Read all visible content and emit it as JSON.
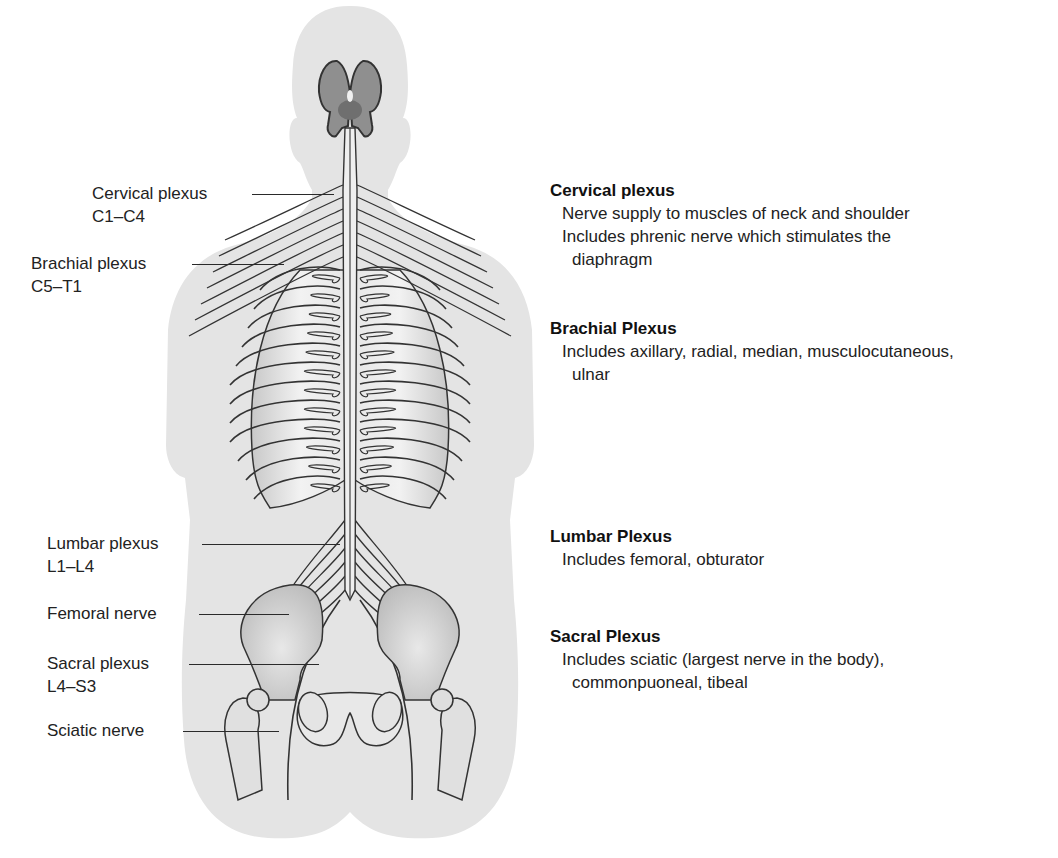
{
  "diagram": {
    "colors": {
      "body_silhouette": "#e4e4e4",
      "rib_cage": "#d2d2d2",
      "brain": "#8a8a8a",
      "nerve_stroke": "#333333"
    }
  },
  "left_labels": [
    {
      "id": "cervical",
      "name": "Cervical plexus",
      "range": "C1–C4"
    },
    {
      "id": "brachial",
      "name": "Brachial plexus",
      "range": "C5–T1"
    },
    {
      "id": "lumbar",
      "name": "Lumbar plexus",
      "range": "L1–L4"
    },
    {
      "id": "femoral",
      "name": "Femoral nerve",
      "range": ""
    },
    {
      "id": "sacral",
      "name": "Sacral plexus",
      "range": "L4–S3"
    },
    {
      "id": "sciatic",
      "name": "Sciatic nerve",
      "range": ""
    }
  ],
  "descriptions": [
    {
      "title": "Cervical plexus",
      "lines": [
        {
          "text": "Nerve supply to muscles of neck and shoulder",
          "cont": false
        },
        {
          "text": "Includes phrenic nerve which stimulates the",
          "cont": false
        },
        {
          "text": "diaphragm",
          "cont": true
        }
      ]
    },
    {
      "title": "Brachial Plexus",
      "lines": [
        {
          "text": "Includes axillary, radial, median, musculocutaneous,",
          "cont": false
        },
        {
          "text": "ulnar",
          "cont": true
        }
      ]
    },
    {
      "title": "Lumbar Plexus",
      "lines": [
        {
          "text": "Includes femoral, obturator",
          "cont": false
        }
      ]
    },
    {
      "title": "Sacral Plexus",
      "lines": [
        {
          "text": "Includes sciatic (largest nerve in the body),",
          "cont": false
        },
        {
          "text": "commonpuoneal, tibeal",
          "cont": true
        }
      ]
    }
  ]
}
